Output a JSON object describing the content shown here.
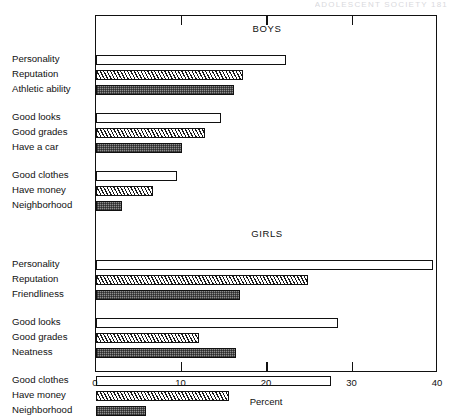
{
  "running_head": "ADOLESCENT SOCIETY   181",
  "chart_data": {
    "type": "bar",
    "orientation": "horizontal",
    "title": "",
    "xlabel": "Percent",
    "ylabel": "",
    "xlim": [
      0,
      40
    ],
    "xticks": [
      0,
      10,
      20,
      30,
      40
    ],
    "xtick_labels": [
      "0",
      "10",
      "20",
      "30",
      "40"
    ],
    "grid": false,
    "legend": "none",
    "panels": [
      {
        "name": "boys",
        "title": "BOYS",
        "groups": [
          {
            "bars": [
              {
                "label": "Personality",
                "value": 22.2,
                "fill": "open"
              },
              {
                "label": "Reputation",
                "value": 17.2,
                "fill": "hatch"
              },
              {
                "label": "Athletic ability",
                "value": 16.1,
                "fill": "check"
              }
            ]
          },
          {
            "bars": [
              {
                "label": "Good looks",
                "value": 14.6,
                "fill": "open"
              },
              {
                "label": "Good grades",
                "value": 12.8,
                "fill": "hatch"
              },
              {
                "label": "Have a car",
                "value": 10.1,
                "fill": "check"
              }
            ]
          },
          {
            "bars": [
              {
                "label": "Good clothes",
                "value": 9.5,
                "fill": "open"
              },
              {
                "label": "Have money",
                "value": 6.7,
                "fill": "hatch"
              },
              {
                "label": "Neighborhood",
                "value": 3.0,
                "fill": "check"
              }
            ]
          }
        ]
      },
      {
        "name": "girls",
        "title": "GIRLS",
        "groups": [
          {
            "bars": [
              {
                "label": "Personality",
                "value": 39.4,
                "fill": "open"
              },
              {
                "label": "Reputation",
                "value": 24.8,
                "fill": "hatch"
              },
              {
                "label": "Friendliness",
                "value": 16.8,
                "fill": "check"
              }
            ]
          },
          {
            "bars": [
              {
                "label": "Good looks",
                "value": 28.3,
                "fill": "open"
              },
              {
                "label": "Good grades",
                "value": 12.1,
                "fill": "hatch"
              },
              {
                "label": "Neatness",
                "value": 16.4,
                "fill": "check"
              }
            ]
          },
          {
            "bars": [
              {
                "label": "Good clothes",
                "value": 27.5,
                "fill": "open"
              },
              {
                "label": "Have money",
                "value": 15.6,
                "fill": "hatch"
              },
              {
                "label": "Neighborhood",
                "value": 5.8,
                "fill": "check"
              }
            ]
          }
        ]
      }
    ]
  }
}
